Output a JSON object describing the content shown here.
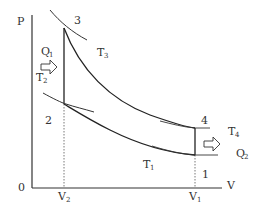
{
  "diagram": {
    "type": "P-V diagram (Otto cycle)",
    "axes": {
      "y_label": "P",
      "x_label": "V",
      "origin_label": "0",
      "x_ticks": [
        {
          "main": "V",
          "sub": "2"
        },
        {
          "main": "V",
          "sub": "1"
        }
      ]
    },
    "points": [
      "1",
      "2",
      "3",
      "4"
    ],
    "isotherms": [
      {
        "main": "T",
        "sub": "3"
      },
      {
        "main": "T",
        "sub": "2"
      },
      {
        "main": "T",
        "sub": "4"
      },
      {
        "main": "T",
        "sub": "1"
      }
    ],
    "heat": [
      {
        "main": "Q",
        "sub": "1",
        "direction": "in"
      },
      {
        "main": "Q",
        "sub": "2",
        "direction": "out"
      }
    ]
  }
}
